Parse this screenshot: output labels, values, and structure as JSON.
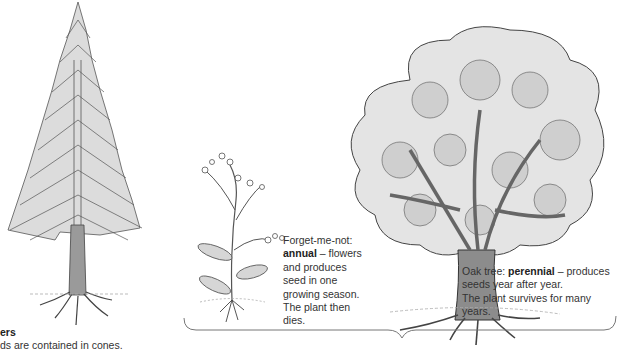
{
  "figure": {
    "plants": [
      {
        "id": "conifer",
        "name": "Conifer",
        "label_title_visible": "ers",
        "label_text_visible": "ds are contained in cones."
      },
      {
        "id": "forget-me-not",
        "name": "Forget-me-not",
        "label_prefix": "Forget-me-not:",
        "label_term": "annual",
        "label_rest": " – flowers and produces seed in one growing season. The plant then dies."
      },
      {
        "id": "oak",
        "name": "Oak tree",
        "label_prefix": "Oak tree: ",
        "label_term": "perennial",
        "label_rest_line1": " – produces",
        "label_line2": "seeds year after year.",
        "label_line3": "The plant survives for many years."
      }
    ],
    "brace": {
      "spans": [
        "forget-me-not",
        "oak"
      ],
      "orientation": "horizontal-down"
    },
    "colors": {
      "ink": "#3a3a3a",
      "trunk": "#8c8c8c",
      "foliage": "#d9d9d9",
      "text": "#333333"
    }
  }
}
